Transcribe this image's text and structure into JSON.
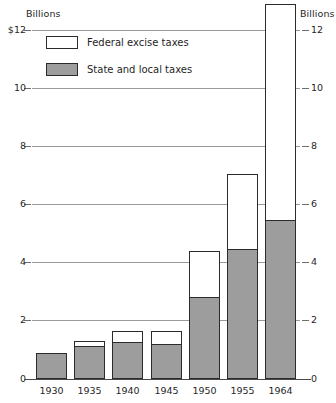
{
  "chart_data": {
    "type": "bar",
    "stacked": true,
    "title": "",
    "subtitle": "",
    "xlabel": "",
    "ylabel": "Billions",
    "ylabel_right": "Billions",
    "categories": [
      "1930",
      "1935",
      "1940",
      "1945",
      "1950",
      "1955",
      "1964"
    ],
    "series": [
      {
        "name": "State and local taxes",
        "color": "#9d9d9d",
        "values": [
          0.9,
          1.15,
          1.3,
          1.2,
          2.85,
          4.5,
          5.5
        ]
      },
      {
        "name": "Federal excise taxes",
        "color": "#ffffff",
        "values": [
          0.0,
          0.15,
          0.35,
          0.45,
          1.55,
          2.55,
          7.4
        ]
      }
    ],
    "totals": [
      0.9,
      1.3,
      1.65,
      1.65,
      4.4,
      7.05,
      12.9
    ],
    "ylim": [
      0,
      12.9
    ],
    "yticks": [
      0,
      2,
      4,
      6,
      8,
      10,
      12
    ],
    "ytick_labels_left": [
      "0",
      "2",
      "4",
      "6",
      "8",
      "10",
      "$12"
    ],
    "ytick_labels_right": [
      "0",
      "2",
      "4",
      "6",
      "8",
      "10",
      "12"
    ],
    "grid": true,
    "grid_axis": "y",
    "legend_position": "top-left",
    "legend": [
      {
        "label": "Federal excise taxes",
        "swatch": "federal"
      },
      {
        "label": "State and local taxes",
        "swatch": "state"
      }
    ]
  },
  "axis": {
    "left_title": "Billions",
    "right_title": "Billions"
  },
  "colors": {
    "state_fill": "#9d9d9d",
    "federal_fill": "#ffffff",
    "bar_outline": "#2b2b2b",
    "gridline": "#9a9a9a"
  }
}
